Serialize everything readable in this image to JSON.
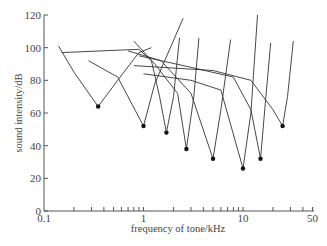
{
  "chart_data": {
    "type": "line",
    "title": "",
    "xlabel": "frequency of tone/kHz",
    "ylabel": "sound intensity/dB",
    "xscale": "log",
    "xlim": [
      0.1,
      50
    ],
    "ylim": [
      0,
      120
    ],
    "x_tick_labels": [
      "0.1",
      "1",
      "10",
      "50"
    ],
    "y_tick_labels": [
      "0",
      "20",
      "40",
      "60",
      "80",
      "100",
      "120"
    ],
    "grid": false,
    "legend": null,
    "series": [
      {
        "name": "fibre 1",
        "characteristic_frequency_khz": 0.35,
        "threshold_db": 64,
        "points": [
          [
            0.14,
            101
          ],
          [
            0.2,
            85
          ],
          [
            0.35,
            64
          ],
          [
            0.55,
            80
          ],
          [
            0.9,
            97
          ],
          [
            1.2,
            100
          ]
        ]
      },
      {
        "name": "fibre 2",
        "characteristic_frequency_khz": 1.0,
        "threshold_db": 52,
        "points": [
          [
            0.28,
            92
          ],
          [
            0.55,
            82
          ],
          [
            1.0,
            52
          ],
          [
            1.3,
            78
          ],
          [
            2.5,
            118
          ]
        ]
      },
      {
        "name": "fibre 3",
        "characteristic_frequency_khz": 1.7,
        "threshold_db": 48,
        "points": [
          [
            0.15,
            97
          ],
          [
            0.9,
            99
          ],
          [
            1.2,
            92
          ],
          [
            1.45,
            70
          ],
          [
            1.7,
            48
          ],
          [
            2.0,
            70
          ],
          [
            2.3,
            106
          ]
        ]
      },
      {
        "name": "fibre 4",
        "characteristic_frequency_khz": 2.7,
        "threshold_db": 38,
        "points": [
          [
            0.8,
            104
          ],
          [
            1.3,
            90
          ],
          [
            2.2,
            72
          ],
          [
            2.7,
            38
          ],
          [
            3.2,
            70
          ],
          [
            3.6,
            106
          ]
        ]
      },
      {
        "name": "fibre 5",
        "characteristic_frequency_khz": 5.0,
        "threshold_db": 32,
        "points": [
          [
            0.7,
            98
          ],
          [
            1.5,
            92
          ],
          [
            3.0,
            72
          ],
          [
            5.0,
            32
          ],
          [
            6.0,
            62
          ],
          [
            7.5,
            105
          ]
        ]
      },
      {
        "name": "fibre 6",
        "characteristic_frequency_khz": 10.0,
        "threshold_db": 26,
        "points": [
          [
            1.0,
            84
          ],
          [
            3.0,
            80
          ],
          [
            6.0,
            74
          ],
          [
            10.0,
            26
          ],
          [
            12.0,
            60
          ],
          [
            14.0,
            120
          ]
        ]
      },
      {
        "name": "fibre 7",
        "characteristic_frequency_khz": 15.0,
        "threshold_db": 32,
        "points": [
          [
            0.9,
            95
          ],
          [
            3.0,
            88
          ],
          [
            8.0,
            82
          ],
          [
            12.0,
            62
          ],
          [
            15.0,
            32
          ],
          [
            17.0,
            70
          ],
          [
            19.0,
            103
          ]
        ]
      },
      {
        "name": "fibre 8",
        "characteristic_frequency_khz": 25.0,
        "threshold_db": 52,
        "points": [
          [
            0.8,
            89
          ],
          [
            5.0,
            86
          ],
          [
            12.0,
            80
          ],
          [
            20.0,
            62
          ],
          [
            25.0,
            52
          ],
          [
            28.0,
            70
          ],
          [
            32.0,
            104
          ]
        ]
      }
    ]
  }
}
